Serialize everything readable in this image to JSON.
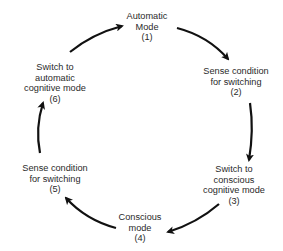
{
  "diagram": {
    "type": "cycle",
    "line_color": "#111111",
    "text_color": "#2a2a2a",
    "nodes": [
      {
        "id": 1,
        "lines": [
          "Automatic",
          "Mode",
          "(1)"
        ]
      },
      {
        "id": 2,
        "lines": [
          "Sense condition",
          "for switching",
          "(2)"
        ]
      },
      {
        "id": 3,
        "lines": [
          "Switch to",
          "conscious",
          "cognitive mode",
          "(3)"
        ]
      },
      {
        "id": 4,
        "lines": [
          "Conscious",
          "mode",
          "(4)"
        ]
      },
      {
        "id": 5,
        "lines": [
          "Sense condition",
          "for switching",
          "(5)"
        ]
      },
      {
        "id": 6,
        "lines": [
          "Switch to",
          "automatic",
          "cognitive mode",
          "(6)"
        ]
      }
    ],
    "edges": [
      {
        "from": 1,
        "to": 2
      },
      {
        "from": 2,
        "to": 3
      },
      {
        "from": 3,
        "to": 4
      },
      {
        "from": 4,
        "to": 5
      },
      {
        "from": 5,
        "to": 6
      },
      {
        "from": 6,
        "to": 1
      }
    ]
  }
}
